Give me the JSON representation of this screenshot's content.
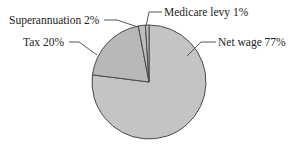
{
  "chart_data": {
    "type": "pie",
    "title": "",
    "categories": [
      "Net wage",
      "Tax",
      "Superannuation",
      "Medicare levy"
    ],
    "values": [
      77,
      20,
      2,
      1
    ],
    "unit": "%",
    "labels": [
      "Net wage 77%",
      "Tax 20%",
      "Superannuation 2%",
      "Medicare levy 1%"
    ],
    "colors": [
      "#c4c4c4",
      "#b8b8b8",
      "#bdbdbd",
      "#bdbdbd"
    ],
    "start_angle_deg": 0,
    "direction": "clockwise",
    "legend": "none (callout labels with leader lines)"
  },
  "labels": {
    "net_wage": "Net wage 77%",
    "tax": "Tax 20%",
    "superannuation": "Superannuation 2%",
    "medicare": "Medicare levy 1%"
  }
}
